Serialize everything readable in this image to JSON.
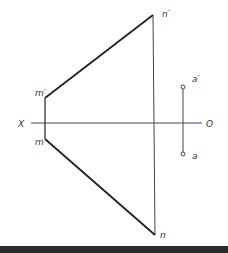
{
  "diagram": {
    "type": "descriptive-geometry projection",
    "axis": {
      "left_label": "X",
      "right_label": "O"
    },
    "points": {
      "n_prime": "n′",
      "m_prime": "m′",
      "m": "m",
      "n": "n",
      "a_prime": "a′",
      "a": "a"
    },
    "colors": {
      "line": "#222222",
      "thin": "#444444",
      "label": "#333333",
      "bar": "#2a2a2a"
    }
  }
}
